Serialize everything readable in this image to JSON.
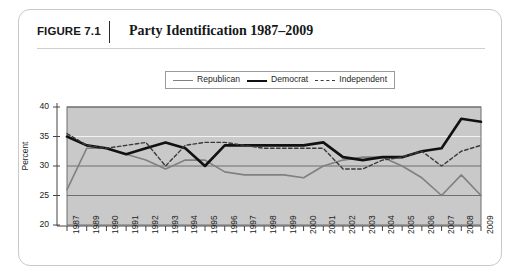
{
  "figure": {
    "number": "FIGURE 7.1",
    "title": "Party Identification 1987–2009"
  },
  "legend": {
    "position": "top-center",
    "entries": [
      {
        "label": "Republican",
        "swatch": "thin-gray-line",
        "color": "#808080"
      },
      {
        "label": "Democrat",
        "swatch": "thick-black-line",
        "color": "#111111"
      },
      {
        "label": "Independent",
        "swatch": "dashed-line",
        "color": "#3a3a3a"
      }
    ]
  },
  "chart_data": {
    "type": "line",
    "title": "Party Identification 1987–2009",
    "xlabel": "",
    "ylabel": "Percent",
    "ylim": [
      20,
      40
    ],
    "yticks": [
      20,
      25,
      30,
      35,
      40
    ],
    "grid": true,
    "legend_position": "top-center",
    "plot_background": "#c9c9c9",
    "categories": [
      "1987",
      "1989",
      "1990",
      "1991",
      "1992",
      "1993",
      "1994",
      "1995",
      "1996",
      "1997",
      "1998",
      "1999",
      "2000",
      "2001",
      "2002",
      "2003",
      "2004",
      "2005",
      "2006",
      "2007",
      "2008",
      "2009"
    ],
    "series": [
      {
        "name": "Republican",
        "color": "#808080",
        "style": "solid",
        "width": 1.6,
        "values": [
          26.0,
          33.0,
          33.0,
          32.0,
          31.0,
          29.5,
          31.0,
          31.0,
          29.0,
          28.5,
          28.5,
          28.5,
          28.0,
          30.0,
          31.0,
          31.5,
          31.5,
          30.0,
          28.0,
          25.0,
          28.5,
          25.0
        ]
      },
      {
        "name": "Democrat",
        "color": "#111111",
        "style": "solid",
        "width": 2.6,
        "values": [
          35.0,
          33.5,
          33.0,
          32.0,
          33.0,
          34.0,
          33.0,
          30.0,
          33.5,
          33.5,
          33.5,
          33.5,
          33.5,
          34.0,
          31.5,
          31.0,
          31.5,
          31.5,
          32.5,
          33.0,
          38.0,
          37.5
        ]
      },
      {
        "name": "Independent",
        "color": "#3a3a3a",
        "style": "dashed",
        "width": 1.4,
        "values": [
          35.5,
          33.5,
          33.0,
          33.5,
          34.0,
          30.0,
          33.5,
          34.0,
          34.0,
          33.5,
          33.0,
          33.0,
          33.0,
          33.0,
          29.5,
          29.5,
          31.0,
          31.5,
          32.5,
          30.0,
          32.5,
          33.5
        ]
      }
    ]
  }
}
